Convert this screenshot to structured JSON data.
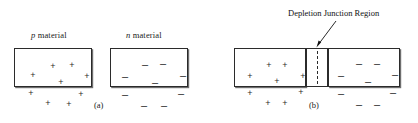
{
  "figure": {
    "width": 418,
    "height": 123,
    "background": "#ffffff",
    "ink_color": "#2b2b2b",
    "shadow_color": "#6e6e6e"
  },
  "panel_a": {
    "caption": "(a)",
    "p_label_italic": "p",
    "p_label_rest": " material",
    "n_label_italic": "n",
    "n_label_rest": " material",
    "p_box": {
      "name": "p-material-block",
      "charge_symbol": "+",
      "charge_count": 9,
      "charges": [
        {
          "x": 18,
          "y": 26
        },
        {
          "x": 38,
          "y": 17
        },
        {
          "x": 57,
          "y": 16
        },
        {
          "x": 72,
          "y": 27
        },
        {
          "x": 46,
          "y": 33
        },
        {
          "x": 16,
          "y": 44
        },
        {
          "x": 66,
          "y": 45
        },
        {
          "x": 33,
          "y": 54
        },
        {
          "x": 54,
          "y": 55
        }
      ]
    },
    "n_box": {
      "name": "n-material-block",
      "charge_symbol": "–",
      "charge_count": 9,
      "charges": [
        {
          "x": 34,
          "y": 15
        },
        {
          "x": 52,
          "y": 14
        },
        {
          "x": 14,
          "y": 27
        },
        {
          "x": 72,
          "y": 26
        },
        {
          "x": 44,
          "y": 33
        },
        {
          "x": 14,
          "y": 45
        },
        {
          "x": 70,
          "y": 44
        },
        {
          "x": 33,
          "y": 56
        },
        {
          "x": 53,
          "y": 56
        }
      ]
    }
  },
  "panel_b": {
    "caption": "(b)",
    "annotation": "Depletion Junction Region",
    "p_side": {
      "name": "p-side-block",
      "charge_symbol": "+",
      "charge_count": 9,
      "charges": [
        {
          "x": 15,
          "y": 27
        },
        {
          "x": 34,
          "y": 16
        },
        {
          "x": 50,
          "y": 16
        },
        {
          "x": 68,
          "y": 27
        },
        {
          "x": 42,
          "y": 32
        },
        {
          "x": 15,
          "y": 44
        },
        {
          "x": 66,
          "y": 43
        },
        {
          "x": 33,
          "y": 54
        },
        {
          "x": 50,
          "y": 54
        }
      ]
    },
    "depletion": {
      "name": "depletion-junction-region",
      "left_edge_x": 306,
      "right_edge_x": 328,
      "dashed_center_x": 317
    },
    "n_side": {
      "name": "n-side-block",
      "charge_symbol": "–",
      "charge_count": 9,
      "charges": [
        {
          "x": 30,
          "y": 14
        },
        {
          "x": 48,
          "y": 14
        },
        {
          "x": 12,
          "y": 26
        },
        {
          "x": 66,
          "y": 25
        },
        {
          "x": 39,
          "y": 32
        },
        {
          "x": 12,
          "y": 44
        },
        {
          "x": 64,
          "y": 43
        },
        {
          "x": 30,
          "y": 55
        },
        {
          "x": 48,
          "y": 55
        }
      ]
    }
  }
}
